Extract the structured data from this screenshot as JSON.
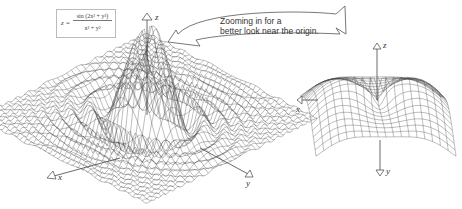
{
  "figure": {
    "formula": {
      "lhs": "z =",
      "numerator": "sin (2x² + y²)",
      "denominator": "x² + y²"
    },
    "callout": {
      "line1": "Zooming in for a",
      "line2": "better look near the origin."
    },
    "left_plot": {
      "description": "3D wireframe surface of z = sin(2x²+y²)/(x²+y²)",
      "axes": {
        "x": "x",
        "y": "y",
        "z": "z"
      }
    },
    "right_plot": {
      "description": "Zoomed-in wireframe surface near the origin",
      "axes": {
        "x": "x",
        "y": "y",
        "z": "z"
      }
    },
    "colors": {
      "line": "#444444",
      "box_border": "#bbbbbb",
      "background": "#ffffff"
    }
  }
}
